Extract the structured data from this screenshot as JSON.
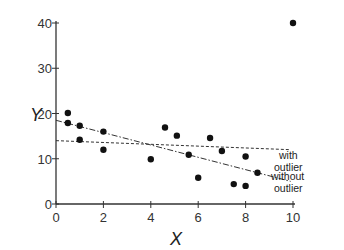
{
  "chart_data": {
    "type": "scatter",
    "title": "",
    "xlabel": "X",
    "ylabel": "Y",
    "xlim": [
      0,
      10
    ],
    "ylim": [
      0,
      40
    ],
    "xticks": [
      0,
      2,
      4,
      6,
      8,
      10
    ],
    "yticks": [
      0,
      10,
      20,
      30,
      40
    ],
    "grid": false,
    "points": [
      {
        "x": 0.5,
        "y": 20.1
      },
      {
        "x": 0.5,
        "y": 17.9
      },
      {
        "x": 1,
        "y": 17.3
      },
      {
        "x": 1,
        "y": 14.2
      },
      {
        "x": 2,
        "y": 16
      },
      {
        "x": 2,
        "y": 12
      },
      {
        "x": 4,
        "y": 9.9
      },
      {
        "x": 4.6,
        "y": 16.9
      },
      {
        "x": 5.1,
        "y": 15.1
      },
      {
        "x": 5.6,
        "y": 10.9
      },
      {
        "x": 6,
        "y": 5.8
      },
      {
        "x": 6.5,
        "y": 14.6
      },
      {
        "x": 7,
        "y": 11.7
      },
      {
        "x": 7.5,
        "y": 4.4
      },
      {
        "x": 8,
        "y": 4
      },
      {
        "x": 8,
        "y": 10.5
      },
      {
        "x": 8.5,
        "y": 6.9
      },
      {
        "x": 10,
        "y": 40
      }
    ],
    "series": [
      {
        "name": "with outlier",
        "style": "dashed",
        "x": [
          0,
          9.9
        ],
        "y": [
          14,
          12
        ]
      },
      {
        "name": "without outlier",
        "style": "dash-dot",
        "x": [
          0,
          9.9
        ],
        "y": [
          18.5,
          5
        ]
      }
    ],
    "annotations": [
      {
        "text": [
          "with",
          "outlier"
        ],
        "near_series": "with outlier"
      },
      {
        "text": [
          "without",
          "outlier"
        ],
        "near_series": "without outlier"
      }
    ]
  }
}
